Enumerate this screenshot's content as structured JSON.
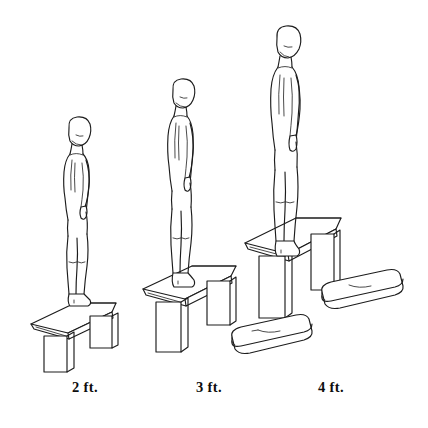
{
  "illustration": {
    "title": "Depth jump / drop jump platform heights",
    "style": "pen-and-ink line drawing",
    "background_color": "#ffffff",
    "ink_color": "#1c1c1c",
    "panels": [
      {
        "id": "panel-2ft",
        "caption": "2 ft.",
        "caption_x": 85,
        "platform_height_ft": 2,
        "figure": "standing-person-profile",
        "facing": "right",
        "bench": "perspective-bench-low"
      },
      {
        "id": "panel-3ft",
        "caption": "3 ft.",
        "caption_x": 209,
        "platform_height_ft": 3,
        "figure": "standing-person-profile",
        "facing": "right",
        "bench": "perspective-bench-mid"
      },
      {
        "id": "panel-4ft",
        "caption": "4 ft.",
        "caption_x": 331,
        "platform_height_ft": 4,
        "figure": "standing-person-profile",
        "facing": "right",
        "bench": "perspective-bench-tall"
      }
    ],
    "mats": [
      {
        "id": "mat-lower",
        "label": "landing-mat"
      },
      {
        "id": "mat-upper",
        "label": "landing-mat"
      }
    ]
  }
}
